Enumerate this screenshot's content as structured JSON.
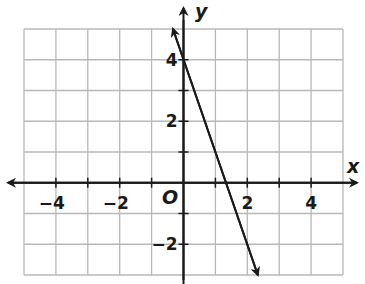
{
  "chart_data": {
    "type": "line",
    "title": "",
    "xlabel": "x",
    "ylabel": "y",
    "origin_label": "O",
    "xlim": [
      -5,
      5
    ],
    "ylim": [
      -3,
      5
    ],
    "grid": true,
    "x_ticks": [
      -4,
      -2,
      2,
      4
    ],
    "y_ticks": [
      4,
      2,
      -2
    ],
    "x_tick_labels": [
      "−4",
      "−2",
      "2",
      "4"
    ],
    "y_tick_labels": [
      "4",
      "2",
      "−2"
    ],
    "series": [
      {
        "name": "line",
        "equation": "y = -3x + 4",
        "x": [
          -0.33,
          0,
          1.33,
          2.33
        ],
        "y": [
          5,
          4,
          0,
          -3
        ],
        "arrows": "both"
      }
    ],
    "colors": {
      "grid": "#b8b8b8",
      "axis": "#1a1a1a",
      "line": "#1a1a1a"
    }
  }
}
